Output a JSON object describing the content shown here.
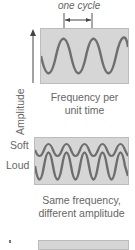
{
  "diagram1": {
    "cycle_label": "one cycle",
    "y_axis_label": "Amplitude",
    "caption_line1": "Frequency per",
    "caption_line2": "unit time"
  },
  "diagram2": {
    "soft_label": "Soft",
    "loud_label": "Loud",
    "caption_line1": "Same frequency,",
    "caption_line2": "different amplitude"
  },
  "colors": {
    "panel": "#d6d6d6",
    "wave": "#6e6e6e",
    "text": "#666666"
  }
}
